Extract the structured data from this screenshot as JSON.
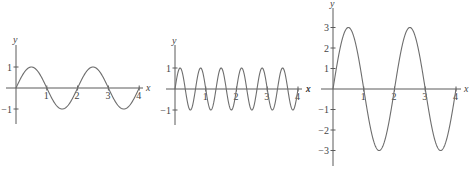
{
  "chart_data": [
    {
      "type": "line",
      "title": "",
      "xlabel": "x",
      "ylabel": "y",
      "function": "y = sin(pi x)",
      "amplitude": 1,
      "period": 2,
      "x_ticks": [
        "1",
        "2",
        "3",
        "4"
      ],
      "y_ticks": [
        "1",
        "−1"
      ],
      "xlim": [
        0,
        4
      ],
      "ylim": [
        -1,
        1
      ],
      "x": [
        0,
        0.5,
        1,
        1.5,
        2,
        2.5,
        3,
        3.5,
        4
      ],
      "values": [
        0,
        1,
        0,
        -1,
        0,
        1,
        0,
        -1,
        0
      ],
      "grid": false,
      "origin": {
        "px": 16,
        "py": 88
      },
      "scale": {
        "x": 30.8,
        "y": 21
      }
    },
    {
      "type": "line",
      "title": "",
      "xlabel": "x",
      "ylabel": "y",
      "function": "y = sin(3 pi x)",
      "amplitude": 1,
      "period": 0.6667,
      "x_ticks": [
        "1",
        "2",
        "3",
        "4"
      ],
      "y_ticks": [
        "1",
        "−1"
      ],
      "xlim": [
        0,
        4
      ],
      "ylim": [
        -1,
        1
      ],
      "x": [
        0,
        0.1667,
        0.3333,
        0.5,
        0.6667,
        1,
        1.3333,
        2,
        2.6667,
        3.3333,
        4
      ],
      "values": [
        0,
        1,
        0,
        -1,
        0,
        0,
        0,
        0,
        0,
        0,
        0
      ],
      "grid": false,
      "origin": {
        "px": 175,
        "py": 89
      },
      "scale": {
        "x": 30.75,
        "y": 21
      }
    },
    {
      "type": "line",
      "title": "",
      "xlabel": "x",
      "ylabel": "y",
      "function": "y = 3 sin(pi x)",
      "amplitude": 3,
      "period": 2,
      "x_ticks": [
        "1",
        "2",
        "3",
        "4"
      ],
      "y_ticks": [
        "3",
        "2",
        "1",
        "−1",
        "−2",
        "−3"
      ],
      "xlim": [
        0,
        4
      ],
      "ylim": [
        -3,
        3
      ],
      "x": [
        0,
        0.5,
        1,
        1.5,
        2,
        2.5,
        3,
        3.5,
        4
      ],
      "values": [
        0,
        3,
        0,
        -3,
        0,
        3,
        0,
        -3,
        0
      ],
      "grid": false,
      "origin": {
        "px": 333,
        "py": 89
      },
      "scale": {
        "x": 30.75,
        "y": 20.5
      }
    }
  ],
  "labels": {
    "x": "x",
    "y": "y",
    "stray_left_x": "x"
  }
}
